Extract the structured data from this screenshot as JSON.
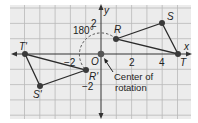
{
  "diagram": {
    "grid": {
      "x_min": -6,
      "x_max": 6,
      "y_min": -4,
      "y_max": 3,
      "unit_px": 15.3,
      "origin_px": [
        101,
        54
      ]
    },
    "axes": {
      "x_label": "x",
      "y_label": "y"
    },
    "ticks": {
      "x": [
        {
          "value": -2,
          "label": "−2"
        },
        {
          "value": 2,
          "label": "2"
        },
        {
          "value": 4,
          "label": "4"
        }
      ],
      "y": [
        {
          "value": 2,
          "label": "2"
        },
        {
          "value": -2,
          "label": "−2"
        }
      ]
    },
    "origin_label": "O",
    "angle_label": "180°",
    "center_label_line1": "Center of",
    "center_label_line2": "rotation",
    "preimage": {
      "name": "triangle RST",
      "vertices": [
        {
          "label": "R",
          "x": 1,
          "y": 1
        },
        {
          "label": "S",
          "x": 4,
          "y": 2
        },
        {
          "label": "T",
          "x": 5,
          "y": 0
        }
      ]
    },
    "image": {
      "name": "triangle R'S'T'",
      "vertices": [
        {
          "label": "R'",
          "x": -1,
          "y": -1
        },
        {
          "label": "S'",
          "x": -4,
          "y": -2
        },
        {
          "label": "T'",
          "x": -5,
          "y": 0
        }
      ]
    },
    "colors": {
      "grid_bg": "#ececec",
      "grid_line": "#b4b4b4",
      "axis": "#333333",
      "segment": "#2b2b2b",
      "point": "#3a3a3a",
      "arc": "#555555"
    }
  }
}
